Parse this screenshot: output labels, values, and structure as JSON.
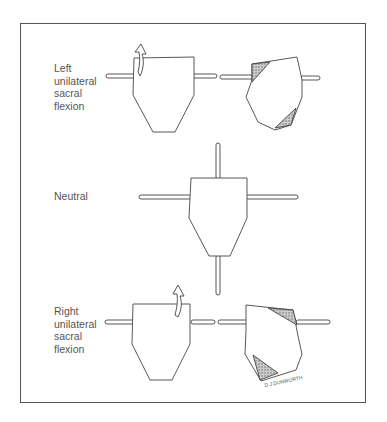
{
  "figure": {
    "type": "sacral flexion diagram",
    "panels": [
      {
        "id": "left",
        "label": "Left\nunilateral\nsacral\nflexion"
      },
      {
        "id": "neutral",
        "label": "Neutral"
      },
      {
        "id": "right",
        "label": "Right\nunilateral\nsacral\nflexion"
      }
    ],
    "signature": "D.J.DUNWORTH",
    "colors": {
      "line": "#444444",
      "hatch": "#9a9a9a",
      "frame": "#555555",
      "text": "#555555"
    }
  }
}
